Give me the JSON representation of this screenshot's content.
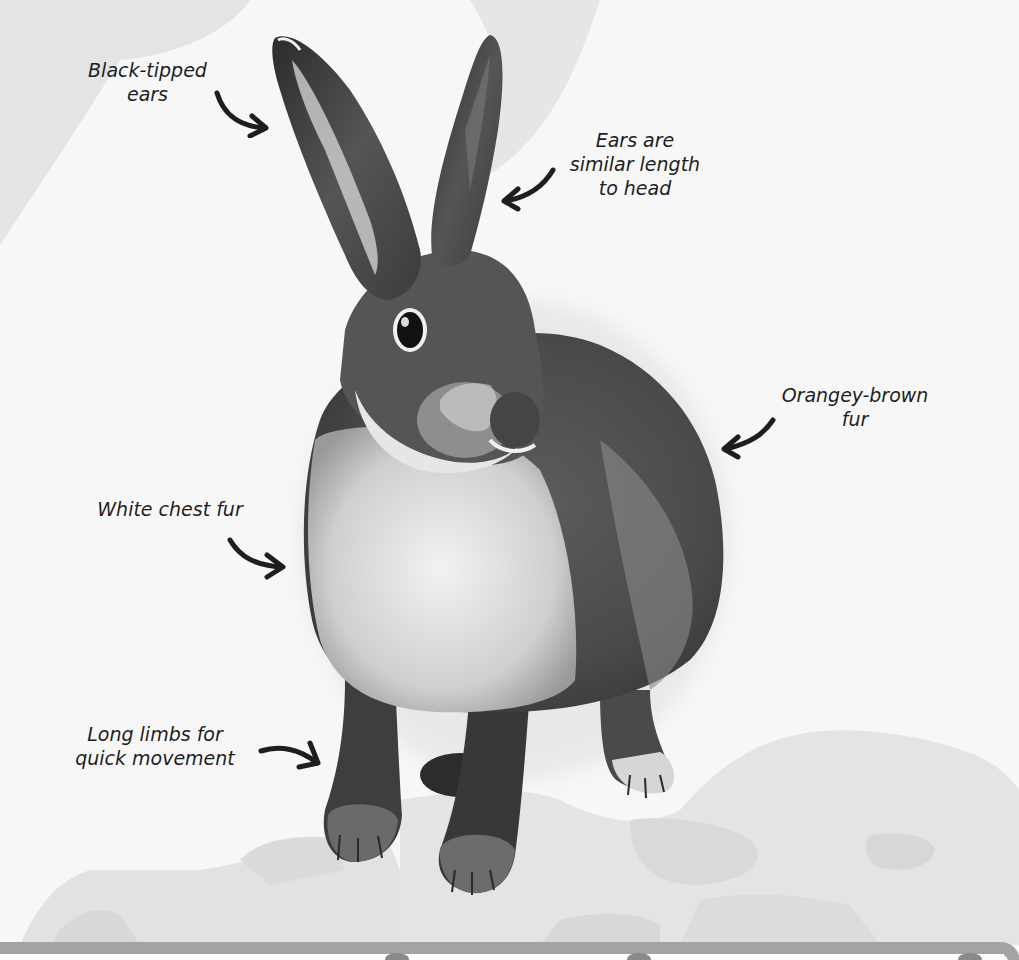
{
  "diagram": {
    "style": "grayscale illustration with callout labels",
    "colors": {
      "background": "#f7f7f7",
      "swoosh": "#e3e3e3",
      "rocks_light": "#e4e4e4",
      "rocks_mid": "#d9d9d9",
      "frame_bar": "#a8a8a8",
      "text": "#1e1e1e",
      "fur_dark": "#3a3a3a",
      "fur_mid": "#6e6e6e",
      "fur_light": "#e9e9e9"
    },
    "labels": [
      {
        "id": "ears-tip",
        "lines": [
          "Black-tipped",
          "ears"
        ],
        "arrow_direction": "right-down"
      },
      {
        "id": "ears-length",
        "lines": [
          "Ears are",
          "similar length",
          "to head"
        ],
        "arrow_direction": "left-down"
      },
      {
        "id": "fur-colour",
        "lines": [
          "Orangey-brown",
          "fur"
        ],
        "arrow_direction": "left-down"
      },
      {
        "id": "chest",
        "lines": [
          "White chest fur"
        ],
        "arrow_direction": "right-down"
      },
      {
        "id": "limbs",
        "lines": [
          "Long limbs for",
          "quick movement"
        ],
        "arrow_direction": "right-down"
      }
    ]
  }
}
